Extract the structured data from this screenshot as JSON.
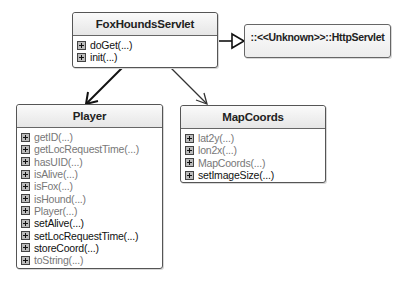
{
  "diagram": {
    "type": "UML class diagram",
    "classes": [
      {
        "name": "FoxHoundsServlet",
        "methods": [
          {
            "label": "doGet(...)",
            "style": "black"
          },
          {
            "label": "init(...)",
            "style": "black"
          }
        ]
      },
      {
        "name": "Player",
        "methods": [
          {
            "label": "getID(...)",
            "style": "grey"
          },
          {
            "label": "getLocRequestTime(...)",
            "style": "grey"
          },
          {
            "label": "hasUID(...)",
            "style": "grey"
          },
          {
            "label": "isAlive(...)",
            "style": "grey"
          },
          {
            "label": "isFox(...)",
            "style": "grey"
          },
          {
            "label": "isHound(...)",
            "style": "grey"
          },
          {
            "label": "Player(...)",
            "style": "grey"
          },
          {
            "label": "setAlive(...)",
            "style": "black"
          },
          {
            "label": "setLocRequestTime(...)",
            "style": "black"
          },
          {
            "label": "storeCoord(...)",
            "style": "black"
          },
          {
            "label": "toString(...)",
            "style": "grey"
          }
        ]
      },
      {
        "name": "MapCoords",
        "methods": [
          {
            "label": "lat2y(...)",
            "style": "grey"
          },
          {
            "label": "lon2x(...)",
            "style": "grey"
          },
          {
            "label": "MapCoords(...)",
            "style": "grey"
          },
          {
            "label": "setImageSize(...)",
            "style": "black"
          }
        ]
      }
    ],
    "external": {
      "label": "::<<Unknown>>::HttpServlet"
    },
    "relations": [
      {
        "from": "FoxHoundsServlet",
        "to": "::<<Unknown>>::HttpServlet",
        "kind": "generalization"
      },
      {
        "from": "FoxHoundsServlet",
        "to": "Player",
        "kind": "association"
      },
      {
        "from": "FoxHoundsServlet",
        "to": "MapCoords",
        "kind": "association"
      }
    ],
    "icons": {
      "method_icon": "expander-plus-icon"
    }
  }
}
